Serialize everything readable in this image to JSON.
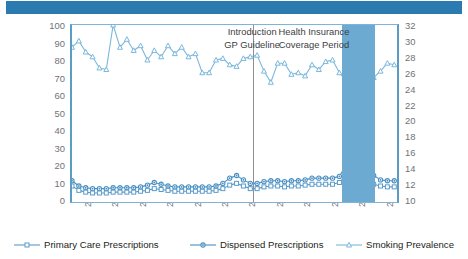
{
  "axes": {
    "y_left_label": "Number of (dispensed) Prescriptions per 1,000 Smokers",
    "y_right_label": "Smoking Prevalence (%)",
    "y_left_ticks": [
      "100",
      "90",
      "80",
      "70",
      "60",
      "50",
      "40",
      "30",
      "20",
      "10",
      "0"
    ],
    "y_right_ticks": [
      "32",
      "30",
      "28",
      "26",
      "24",
      "22",
      "20",
      "18",
      "16",
      "14",
      "12",
      "10"
    ],
    "x_ticks": [
      "2001",
      "2002",
      "2003",
      "2004",
      "2005",
      "2006",
      "2007",
      "2008",
      "2009",
      "2010",
      "2011",
      "2012"
    ]
  },
  "annotations": {
    "gp_line1": "Introduction",
    "gp_line2": "GP Guideline",
    "ins_line1": "Health Insurance",
    "ins_line2": "Coverage Period"
  },
  "legend": {
    "items": [
      {
        "label": "Primary Care Prescriptions",
        "marker": "square",
        "color": "#5b9bc9"
      },
      {
        "label": "Dispensed Prescriptions",
        "marker": "circle",
        "color": "#4a90c2"
      },
      {
        "label": "Smoking Prevalence",
        "marker": "triangle",
        "color": "#7ab8dc"
      }
    ]
  },
  "colors": {
    "header_band": "#2b7ab0",
    "highlight_band": "#6caad2",
    "divider": "#8d9197",
    "primary_care": "#5b9bc9",
    "dispensed": "#4a90c2",
    "prevalence": "#7ab8dc",
    "frame": "#7fb4d6"
  },
  "chart_data": {
    "type": "line",
    "title": "",
    "xlabel": "",
    "ylabel": "Number of (dispensed) Prescriptions per 1,000 Smokers",
    "y2label": "Smoking Prevalence (%)",
    "ylim": [
      0,
      100
    ],
    "y2lim": [
      10,
      32
    ],
    "xlim": [
      2001.0,
      2012.85
    ],
    "grid": false,
    "legend_position": "below",
    "x": [
      2001.0,
      2001.25,
      2001.5,
      2001.75,
      2002.0,
      2002.25,
      2002.5,
      2002.75,
      2003.0,
      2003.25,
      2003.5,
      2003.75,
      2004.0,
      2004.25,
      2004.5,
      2004.75,
      2005.0,
      2005.25,
      2005.5,
      2005.75,
      2006.0,
      2006.25,
      2006.5,
      2006.75,
      2007.0,
      2007.25,
      2007.5,
      2007.75,
      2008.0,
      2008.25,
      2008.5,
      2008.75,
      2009.0,
      2009.25,
      2009.5,
      2009.75,
      2010.0,
      2010.25,
      2010.5,
      2010.75,
      2011.0,
      2011.25,
      2011.5,
      2011.75,
      2012.0,
      2012.25,
      2012.5,
      2012.75
    ],
    "annotations": [
      {
        "text": "Introduction GP Guideline",
        "x": 2007.6
      },
      {
        "text": "Health Insurance Coverage Period",
        "x": 2009.6
      }
    ],
    "vlines": [
      {
        "x": 2007.6,
        "color": "#8d9197"
      }
    ],
    "vspans": [
      {
        "x0": 2010.85,
        "x1": 2012.05,
        "color": "#6caad2",
        "label": "Health Insurance Coverage Period"
      }
    ],
    "series": [
      {
        "name": "Smoking Prevalence",
        "axis": "right",
        "unit": "%",
        "marker": "triangle",
        "color": "#7ab8dc",
        "values": [
          29.2,
          30.0,
          28.6,
          28.0,
          26.6,
          26.4,
          32.0,
          29.2,
          30.2,
          28.8,
          29.4,
          27.6,
          28.8,
          28.0,
          29.4,
          28.4,
          29.2,
          28.0,
          28.4,
          26.0,
          26.0,
          27.6,
          27.8,
          27.0,
          26.8,
          27.8,
          28.0,
          28.2,
          26.2,
          24.8,
          27.2,
          27.2,
          25.8,
          26.0,
          25.6,
          27.0,
          26.4,
          27.4,
          27.6,
          26.0,
          25.0,
          25.6,
          26.8,
          25.4,
          25.4,
          26.2,
          27.2,
          27.0
        ]
      },
      {
        "name": "Dispensed Prescriptions",
        "axis": "left",
        "marker": "circle",
        "color": "#4a90c2",
        "values": [
          11.0,
          8.0,
          7.0,
          6.5,
          6.5,
          6.5,
          7.0,
          7.0,
          7.0,
          7.0,
          7.5,
          8.5,
          10.0,
          9.0,
          8.0,
          7.5,
          7.5,
          7.5,
          7.5,
          7.5,
          7.5,
          8.0,
          9.5,
          12.5,
          14.0,
          11.5,
          9.5,
          9.5,
          10.5,
          11.0,
          11.0,
          10.5,
          11.0,
          11.0,
          11.5,
          12.5,
          12.5,
          12.5,
          12.5,
          13.5,
          20.0,
          22.5,
          24.0,
          44.0,
          14.0,
          11.5,
          11.0,
          11.0
        ]
      },
      {
        "name": "Primary Care Prescriptions",
        "axis": "left",
        "marker": "square",
        "color": "#5b9bc9",
        "values": [
          8.0,
          5.5,
          4.5,
          4.0,
          4.0,
          4.0,
          4.5,
          4.5,
          4.5,
          4.5,
          5.0,
          5.5,
          6.5,
          6.0,
          5.5,
          5.0,
          5.0,
          5.0,
          5.0,
          5.0,
          5.0,
          5.5,
          6.5,
          8.5,
          9.5,
          8.0,
          6.5,
          6.5,
          7.5,
          8.0,
          8.0,
          7.5,
          8.0,
          8.0,
          8.5,
          9.0,
          9.0,
          9.0,
          9.0,
          10.0,
          14.5,
          16.5,
          17.5,
          21.0,
          9.0,
          8.0,
          7.5,
          7.5
        ]
      }
    ]
  }
}
